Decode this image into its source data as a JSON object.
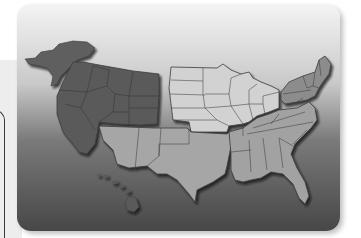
{
  "map": {
    "subject": "United States census regions",
    "regions": [
      {
        "id": "west",
        "name": "West",
        "color": "#5a5a5a"
      },
      {
        "id": "midwest",
        "name": "Midwest",
        "color": "#d2d2d2"
      },
      {
        "id": "northeast",
        "name": "Northeast",
        "color": "#8c8c8c"
      },
      {
        "id": "south",
        "name": "South",
        "color": "#a6a6a6"
      }
    ],
    "insets": [
      {
        "id": "alaska",
        "region": "west"
      },
      {
        "id": "hawaii",
        "region": "west"
      }
    ],
    "colors": {
      "background_top": "#f2f2f2",
      "background_bottom": "#4a4a4a",
      "state_border": "#3c3c3c",
      "shadow": "#1e1e1e"
    }
  }
}
